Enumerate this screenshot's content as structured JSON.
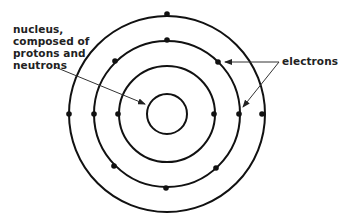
{
  "diagram": {
    "title": "",
    "type": "atom-bohr-model",
    "center": {
      "x": 167,
      "y": 114
    },
    "stroke_color": "#111111",
    "background": "#ffffff",
    "nucleus": {
      "radius": 20
    },
    "shells": [
      {
        "name": "inner",
        "radius": 48,
        "electrons": [
          [
            118,
            114
          ],
          [
            214,
            114
          ]
        ]
      },
      {
        "name": "middle",
        "radius": 73,
        "electrons": [
          [
            167,
            40
          ],
          [
            115,
            61
          ],
          [
            218,
            62
          ],
          [
            94,
            114
          ],
          [
            239,
            114
          ],
          [
            114,
            166
          ],
          [
            216,
            168
          ],
          [
            166,
            188
          ]
        ]
      },
      {
        "name": "outer",
        "radius": 98,
        "electrons": [
          [
            167,
            14
          ],
          [
            69,
            114
          ],
          [
            262,
            114
          ]
        ]
      }
    ],
    "labels": {
      "nucleus": {
        "lines": [
          "nucleus,",
          "composed of",
          "protons and",
          "neutrons"
        ]
      },
      "electrons": {
        "text": "electrons"
      }
    },
    "arrows": [
      {
        "from": [
          55,
          67
        ],
        "to": [
          145,
          104
        ],
        "target": "nucleus"
      },
      {
        "from": [
          279,
          62
        ],
        "to": [
          225,
          62
        ],
        "target": "electron"
      },
      {
        "from": [
          279,
          62
        ],
        "to": [
          243,
          107
        ],
        "target": "electron"
      }
    ]
  }
}
